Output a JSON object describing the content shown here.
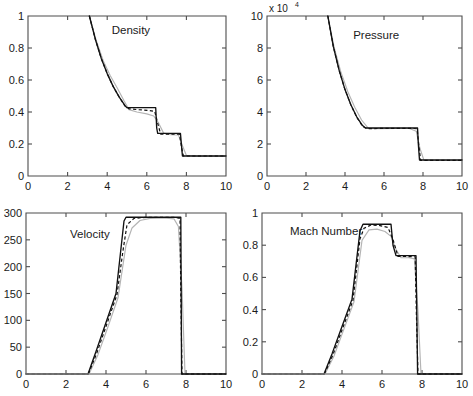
{
  "figure": {
    "width": 473,
    "height": 396,
    "background": "#ffffff",
    "layout": "2x2 grid of line plots"
  },
  "colors": {
    "exact_curve": "#111111",
    "dashed_curve": "#111111",
    "gray_curve": "#b4b4b4",
    "axis": "#4d4d4d",
    "text": "#1a1a1a"
  },
  "chart_data": [
    {
      "type": "line",
      "title": "Density",
      "xlabel": "",
      "ylabel": "",
      "xlim": [
        0,
        10
      ],
      "ylim": [
        0,
        1
      ],
      "xticks": [
        0,
        2,
        4,
        6,
        8,
        10
      ],
      "xticklabels": [
        "0",
        "2",
        "4",
        "6",
        "8",
        "10"
      ],
      "yticks": [
        0,
        0.2,
        0.4,
        0.6,
        0.8,
        1
      ],
      "yticklabels": [
        "0",
        "0.2",
        "0.4",
        "0.6",
        "0.8",
        "1"
      ],
      "grid": false,
      "legend": "none",
      "exponent_label": "",
      "series": [
        {
          "name": "exact",
          "style": "solid",
          "x": [
            3.1,
            3.4,
            3.7,
            4.0,
            4.3,
            4.6,
            4.9,
            5.0,
            5.6,
            6.2,
            6.45,
            6.5,
            6.55,
            7.0,
            7.7,
            7.76,
            7.8,
            8.4,
            10.0
          ],
          "y": [
            1.0,
            0.855,
            0.735,
            0.64,
            0.56,
            0.495,
            0.44,
            0.427,
            0.427,
            0.427,
            0.427,
            0.3,
            0.266,
            0.266,
            0.266,
            0.18,
            0.125,
            0.125,
            0.125
          ]
        },
        {
          "name": "numerical-dashed",
          "style": "dashed",
          "x": [
            3.1,
            3.4,
            3.7,
            4.0,
            4.3,
            4.6,
            4.9,
            5.1,
            5.6,
            6.1,
            6.4,
            6.55,
            6.7,
            7.1,
            7.65,
            7.76,
            7.85,
            8.4,
            10.0
          ],
          "y": [
            1.0,
            0.855,
            0.735,
            0.64,
            0.56,
            0.495,
            0.437,
            0.42,
            0.414,
            0.41,
            0.404,
            0.33,
            0.262,
            0.262,
            0.262,
            0.175,
            0.125,
            0.125,
            0.125
          ]
        },
        {
          "name": "numerical-diffused",
          "style": "gray",
          "x": [
            3.1,
            3.45,
            3.8,
            4.15,
            4.5,
            4.85,
            5.1,
            5.5,
            6.0,
            6.35,
            6.6,
            6.85,
            7.2,
            7.6,
            7.8,
            8.0,
            8.5,
            10.0
          ],
          "y": [
            1.0,
            0.845,
            0.72,
            0.628,
            0.552,
            0.47,
            0.415,
            0.4,
            0.388,
            0.375,
            0.33,
            0.268,
            0.258,
            0.256,
            0.19,
            0.128,
            0.124,
            0.124
          ]
        }
      ]
    },
    {
      "type": "line",
      "title": "Pressure",
      "xlabel": "",
      "ylabel": "",
      "xlim": [
        0,
        10
      ],
      "ylim": [
        0,
        10
      ],
      "xticks": [
        0,
        2,
        4,
        6,
        8,
        10
      ],
      "xticklabels": [
        "0",
        "2",
        "4",
        "6",
        "8",
        "10"
      ],
      "yticks": [
        0,
        2,
        4,
        6,
        8,
        10
      ],
      "yticklabels": [
        "0",
        "2",
        "4",
        "6",
        "8",
        "10"
      ],
      "grid": false,
      "legend": "none",
      "exponent_label": "x 10",
      "exponent_power": "4",
      "units_note": "y values in units of 10^4",
      "series": [
        {
          "name": "exact",
          "style": "solid",
          "x": [
            3.12,
            3.4,
            3.7,
            4.0,
            4.3,
            4.6,
            4.9,
            5.05,
            5.6,
            6.5,
            7.4,
            7.72,
            7.76,
            7.82,
            8.5,
            10.0
          ],
          "y": [
            10.0,
            8.1,
            6.6,
            5.4,
            4.45,
            3.7,
            3.15,
            3.0,
            3.0,
            3.0,
            3.0,
            3.0,
            2.0,
            1.0,
            1.0,
            1.0
          ]
        },
        {
          "name": "numerical-dashed",
          "style": "dashed",
          "x": [
            3.12,
            3.4,
            3.7,
            4.0,
            4.3,
            4.6,
            4.9,
            5.15,
            5.7,
            6.5,
            7.4,
            7.7,
            7.78,
            7.88,
            8.5,
            10.0
          ],
          "y": [
            10.0,
            8.1,
            6.6,
            5.4,
            4.45,
            3.68,
            3.1,
            2.96,
            2.97,
            2.98,
            2.98,
            2.95,
            1.95,
            0.98,
            0.98,
            0.98
          ]
        },
        {
          "name": "numerical-diffused",
          "style": "gray",
          "x": [
            3.12,
            3.45,
            3.8,
            4.15,
            4.5,
            4.85,
            5.2,
            5.8,
            6.6,
            7.3,
            7.65,
            7.85,
            8.05,
            8.6,
            10.0
          ],
          "y": [
            10.0,
            8.0,
            6.45,
            5.25,
            4.3,
            3.5,
            2.98,
            2.96,
            2.97,
            2.97,
            2.8,
            1.7,
            0.98,
            0.97,
            0.97
          ]
        }
      ]
    },
    {
      "type": "line",
      "title": "Velocity",
      "xlabel": "",
      "ylabel": "",
      "xlim": [
        0,
        10
      ],
      "ylim": [
        0,
        300
      ],
      "xticks": [
        0,
        2,
        4,
        6,
        8,
        10
      ],
      "xticklabels": [
        "0",
        "2",
        "4",
        "6",
        "8",
        "10"
      ],
      "yticks": [
        0,
        50,
        100,
        150,
        200,
        250,
        300
      ],
      "yticklabels": [
        "0",
        "50",
        "100",
        "150",
        "200",
        "250",
        "300"
      ],
      "grid": false,
      "legend": "none",
      "exponent_label": "",
      "series": [
        {
          "name": "exact",
          "style": "solid",
          "x": [
            3.1,
            3.5,
            4.0,
            4.5,
            4.9,
            5.0,
            5.8,
            6.6,
            7.4,
            7.74,
            7.76,
            7.78,
            10.0
          ],
          "y": [
            0,
            42,
            96,
            150,
            285,
            292,
            292,
            292,
            292,
            292,
            150,
            0,
            0
          ]
        },
        {
          "name": "numerical-dashed",
          "style": "dashed",
          "x": [
            3.12,
            3.55,
            4.05,
            4.55,
            4.85,
            5.05,
            5.4,
            6.0,
            6.8,
            7.45,
            7.7,
            7.74,
            7.8,
            10.0
          ],
          "y": [
            0,
            40,
            94,
            148,
            230,
            278,
            290,
            292,
            292,
            292,
            290,
            150,
            0,
            0
          ]
        },
        {
          "name": "numerical-diffused",
          "style": "gray",
          "x": [
            3.15,
            3.6,
            4.1,
            4.6,
            5.0,
            5.3,
            5.7,
            6.2,
            6.9,
            7.4,
            7.62,
            7.8,
            7.95,
            10.0
          ],
          "y": [
            0,
            36,
            88,
            142,
            240,
            272,
            286,
            290,
            291,
            289,
            275,
            160,
            0,
            0
          ]
        }
      ]
    },
    {
      "type": "line",
      "title": "Mach Number",
      "xlabel": "",
      "ylabel": "",
      "xlim": [
        0,
        10
      ],
      "ylim": [
        0,
        1
      ],
      "xticks": [
        0,
        2,
        4,
        6,
        8,
        10
      ],
      "xticklabels": [
        "0",
        "2",
        "4",
        "6",
        "8",
        "10"
      ],
      "yticks": [
        0,
        0.2,
        0.4,
        0.6,
        0.8,
        1
      ],
      "yticklabels": [
        "0",
        "0.2",
        "0.4",
        "0.6",
        "0.8",
        "1"
      ],
      "grid": false,
      "legend": "none",
      "exponent_label": "",
      "series": [
        {
          "name": "exact",
          "style": "solid",
          "x": [
            3.1,
            3.5,
            4.0,
            4.5,
            4.9,
            5.05,
            5.6,
            6.2,
            6.45,
            6.55,
            6.7,
            7.2,
            7.7,
            7.74,
            7.78,
            10.0
          ],
          "y": [
            0,
            0.125,
            0.295,
            0.465,
            0.89,
            0.93,
            0.93,
            0.93,
            0.93,
            0.8,
            0.735,
            0.735,
            0.735,
            0.38,
            0,
            0
          ]
        },
        {
          "name": "numerical-dashed",
          "style": "dashed",
          "x": [
            3.12,
            3.55,
            4.05,
            4.55,
            4.9,
            5.1,
            5.45,
            5.9,
            6.3,
            6.55,
            6.8,
            7.25,
            7.66,
            7.72,
            7.8,
            10.0
          ],
          "y": [
            0,
            0.12,
            0.29,
            0.458,
            0.84,
            0.905,
            0.925,
            0.922,
            0.91,
            0.835,
            0.73,
            0.73,
            0.728,
            0.37,
            0,
            0
          ]
        },
        {
          "name": "numerical-diffused",
          "style": "gray",
          "x": [
            3.15,
            3.6,
            4.1,
            4.6,
            5.0,
            5.35,
            5.75,
            6.15,
            6.45,
            6.7,
            6.95,
            7.35,
            7.62,
            7.8,
            7.95,
            10.0
          ],
          "y": [
            0,
            0.112,
            0.28,
            0.448,
            0.83,
            0.895,
            0.9,
            0.885,
            0.855,
            0.775,
            0.722,
            0.722,
            0.715,
            0.39,
            0,
            0
          ]
        }
      ]
    }
  ]
}
